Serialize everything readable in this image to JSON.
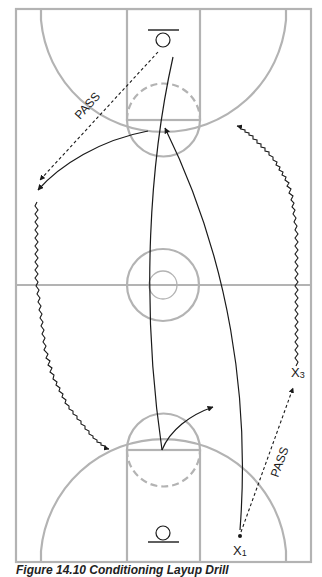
{
  "diagram": {
    "title": "Conditioning Layup Drill",
    "labels": {
      "pass_top": "PASS",
      "pass_bottom": "PASS",
      "player_x1": "X",
      "player_x1_sub": "1",
      "player_x3": "X",
      "player_x3_sub": "3"
    },
    "colors": {
      "court_lines": "#b3b3b3",
      "movement": "#1a1a1a",
      "background": "#ffffff"
    }
  },
  "caption": {
    "text": "Figure 14.10 Conditioning Layup Drill"
  }
}
